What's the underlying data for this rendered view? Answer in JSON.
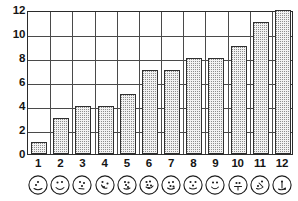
{
  "chart_data": {
    "type": "bar",
    "title": "",
    "xlabel": "",
    "ylabel": "",
    "categories": [
      "1",
      "2",
      "3",
      "4",
      "5",
      "6",
      "7",
      "8",
      "9",
      "10",
      "11",
      "12"
    ],
    "values": [
      1,
      3,
      4,
      4,
      5,
      7,
      7,
      8,
      8,
      9,
      11,
      12
    ],
    "ylim": [
      0,
      12
    ],
    "ytick_labels": [
      "0",
      "2",
      "4",
      "6",
      "8",
      "10",
      "12"
    ],
    "ytick_values": [
      0,
      2,
      4,
      6,
      8,
      10,
      12
    ],
    "grid": true,
    "grid_horizontal_at": [
      2,
      4,
      6,
      8,
      10
    ],
    "grid_vertical_count": 11,
    "legend": "none",
    "bar_fill": "#f2f2f2",
    "bar_dot_color": "#8d8d8d",
    "bar_outline": "#2f2f2f",
    "axis_color": "#2b2b2b",
    "grid_color": "#4a4a4a",
    "background": "#ffffff"
  },
  "axes": {
    "y": {
      "ticks": [
        {
          "label": "12",
          "value": 12
        },
        {
          "label": "10",
          "value": 10
        },
        {
          "label": "8",
          "value": 8
        },
        {
          "label": "6",
          "value": 6
        },
        {
          "label": "4",
          "value": 4
        },
        {
          "label": "2",
          "value": 2
        },
        {
          "label": "0",
          "value": 0
        }
      ]
    },
    "x": {
      "ticks": [
        {
          "label": "1",
          "icon": "die-face-1-icon"
        },
        {
          "label": "2",
          "icon": "die-face-2-icon"
        },
        {
          "label": "3",
          "icon": "die-face-3-icon"
        },
        {
          "label": "4",
          "icon": "die-face-4-icon"
        },
        {
          "label": "5",
          "icon": "die-face-5-icon"
        },
        {
          "label": "6",
          "icon": "die-face-6-icon"
        },
        {
          "label": "7",
          "icon": "die-face-7-icon"
        },
        {
          "label": "8",
          "icon": "die-face-8-icon"
        },
        {
          "label": "9",
          "icon": "die-face-9-icon"
        },
        {
          "label": "10",
          "icon": "die-face-10-icon"
        },
        {
          "label": "11",
          "icon": "die-face-11-icon"
        },
        {
          "label": "12",
          "icon": "die-face-12-icon"
        }
      ]
    }
  }
}
